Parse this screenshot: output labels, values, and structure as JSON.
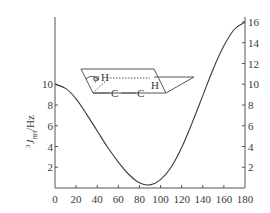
{
  "chart_data": {
    "type": "line",
    "title": "",
    "xlabel": "",
    "ylabel": "³J_HH/Hz",
    "ylabel_parts": {
      "superscript": "3",
      "main": "J",
      "subscript": "HH",
      "unit": "/Hz"
    },
    "xlim": [
      0,
      180
    ],
    "ylim_left": [
      0,
      16
    ],
    "ylim_right": [
      0,
      16
    ],
    "x_ticks": [
      0,
      20,
      40,
      60,
      80,
      100,
      120,
      140,
      160,
      180
    ],
    "y_ticks_left": [
      2,
      4,
      6,
      8,
      10
    ],
    "y_ticks_right": [
      2,
      4,
      6,
      8,
      10,
      12,
      14,
      16
    ],
    "grid": false,
    "legend": null,
    "series": [
      {
        "name": "Karplus curve",
        "x": [
          0,
          10,
          20,
          30,
          40,
          50,
          60,
          70,
          80,
          90,
          100,
          110,
          120,
          130,
          140,
          150,
          160,
          170,
          180
        ],
        "values": [
          10.0,
          9.6,
          8.6,
          7.1,
          5.5,
          3.9,
          2.5,
          1.3,
          0.5,
          0.3,
          0.8,
          2.0,
          3.9,
          6.3,
          8.9,
          11.5,
          13.7,
          15.3,
          16.0
        ]
      }
    ],
    "annotations": [
      {
        "type": "inset-diagram",
        "labels": [
          "φ",
          "H",
          "H",
          "C",
          "C"
        ],
        "description": "Newman-like projection showing dihedral angle φ between H–C–C–H"
      }
    ]
  },
  "inset": {
    "phi": "φ",
    "h_left": "H",
    "h_right": "H",
    "c_left": "C",
    "c_right": "C"
  },
  "axis": {
    "ylabel_sup": "3",
    "ylabel_main": "J",
    "ylabel_sub": "HH",
    "ylabel_unit": "/Hz"
  },
  "colors": {
    "line": "#3a3a3a",
    "axis": "#555555",
    "text": "#3a3a3a"
  }
}
